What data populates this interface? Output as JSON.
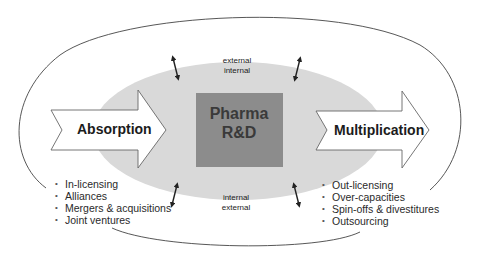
{
  "diagram": {
    "center": {
      "line1": "Pharma",
      "line2": "R&D"
    },
    "left_arrow": {
      "label": "Absorption"
    },
    "right_arrow": {
      "label": "Multiplication"
    },
    "boundary_top": {
      "outer": "external",
      "inner": "internal"
    },
    "boundary_bottom": {
      "inner": "internal",
      "outer": "external"
    },
    "absorption_items": [
      "In-licensing",
      "Alliances",
      "Mergers & acquisitions",
      "Joint ventures"
    ],
    "multiplication_items": [
      "Out-licensing",
      "Over-capacities",
      "Spin-offs & divestitures",
      "Outsourcing"
    ]
  },
  "colors": {
    "inner_ellipse": "#d9d9d9",
    "center_box": "#8c8c8c",
    "center_text": "#3a3a3a",
    "outline": "#444444",
    "arrow_fill": "#ffffff"
  }
}
